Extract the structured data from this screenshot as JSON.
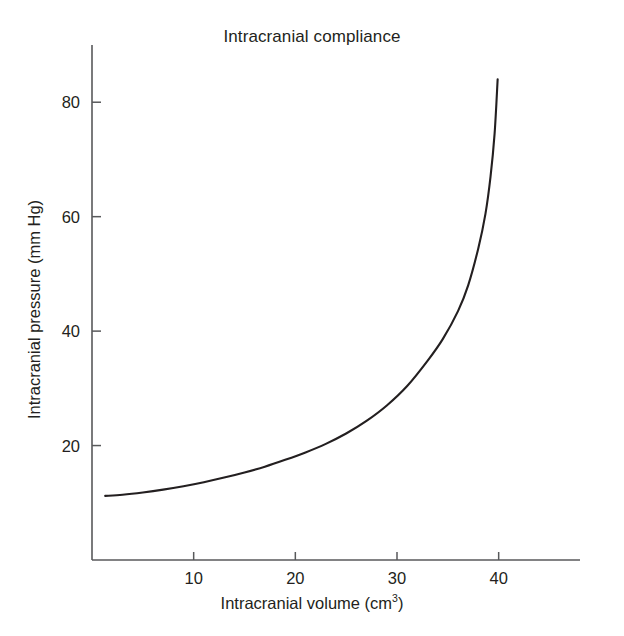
{
  "chart_data": {
    "type": "line",
    "title": "Intracranial compliance",
    "xlabel_text": "Intracranial volume (cm",
    "xlabel_sup": "3",
    "xlabel_tail": ")",
    "ylabel_text": "Intracranial pressure (mm Hg)",
    "xlabel": "Intracranial volume (cm3)",
    "ylabel": "Intracranial pressure (mm Hg)",
    "grid": false,
    "legend": "none",
    "xlim": [
      0,
      48
    ],
    "ylim": [
      0,
      90
    ],
    "xticks": [
      10,
      20,
      30,
      40
    ],
    "xtick_labels": [
      "10",
      "20",
      "30",
      "40"
    ],
    "yticks": [
      20,
      40,
      60,
      80
    ],
    "ytick_labels": [
      "20",
      "40",
      "60",
      "80"
    ],
    "series": [
      {
        "name": "Intracranial pressure vs volume",
        "x": [
          1.3,
          3,
          5,
          7,
          9,
          11,
          13,
          15,
          17,
          19,
          21,
          23,
          25,
          27,
          29,
          31,
          33,
          34.5,
          36,
          37,
          38,
          38.7,
          39.2,
          39.6,
          39.9
        ],
        "y": [
          11.2,
          11.4,
          11.8,
          12.3,
          12.9,
          13.6,
          14.4,
          15.3,
          16.3,
          17.5,
          18.8,
          20.3,
          22.1,
          24.3,
          27.0,
          30.4,
          34.8,
          38.6,
          43.5,
          48.0,
          54.5,
          60.5,
          67.0,
          74.5,
          84.0
        ]
      }
    ],
    "annotations": [],
    "line_color": "#231f20",
    "axis_color": "#58595b",
    "background_color": "#ffffff"
  },
  "figure": {
    "plot_area": {
      "left_px": 92,
      "right_px": 580,
      "top_px": 45,
      "bottom_px": 560
    }
  }
}
